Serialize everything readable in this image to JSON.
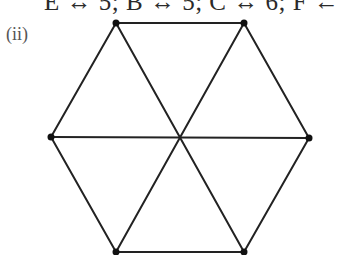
{
  "caption": "E ↔ 5; B ↔ 5; C ↔ 6; F ←",
  "part_label": "(ii)",
  "diagram": {
    "type": "graph",
    "vertices": [
      {
        "id": "v1",
        "x": 116,
        "y": 23
      },
      {
        "id": "v2",
        "x": 244,
        "y": 23
      },
      {
        "id": "v3",
        "x": 309,
        "y": 138
      },
      {
        "id": "v4",
        "x": 244,
        "y": 252
      },
      {
        "id": "v5",
        "x": 116,
        "y": 252
      },
      {
        "id": "v6",
        "x": 51,
        "y": 137
      }
    ],
    "edges": [
      [
        "v1",
        "v2"
      ],
      [
        "v2",
        "v3"
      ],
      [
        "v3",
        "v4"
      ],
      [
        "v4",
        "v5"
      ],
      [
        "v5",
        "v6"
      ],
      [
        "v6",
        "v1"
      ],
      [
        "v1",
        "v4"
      ],
      [
        "v2",
        "v5"
      ],
      [
        "v6",
        "v3"
      ]
    ],
    "stroke_color": "#222222",
    "vertex_color": "#111111"
  }
}
